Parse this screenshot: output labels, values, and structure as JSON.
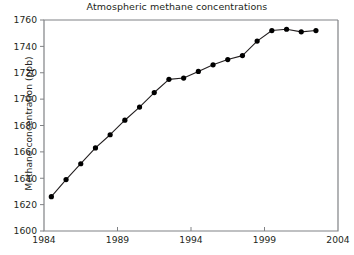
{
  "chart_data": {
    "type": "line",
    "title": "Atmospheric methane concentrations",
    "xlabel": "",
    "ylabel": "Methane concentration (ppb)",
    "xlim": [
      1984,
      2004
    ],
    "ylim": [
      1600,
      1760
    ],
    "xticks": [
      1984,
      1989,
      1994,
      1999,
      2004
    ],
    "xtick_labels": [
      "1984",
      "1989",
      "1994",
      "1999",
      "2004"
    ],
    "yticks": [
      1600,
      1620,
      1640,
      1660,
      1680,
      1700,
      1720,
      1740,
      1760
    ],
    "ytick_labels": [
      "1600",
      "1620",
      "1640",
      "1660",
      "1680",
      "1700",
      "1720",
      "1740",
      "1760"
    ],
    "grid": false,
    "legend": false,
    "marker": "filled-circle",
    "marker_color": "#000000",
    "line_color": "#231f20",
    "x": [
      1984.5,
      1985.5,
      1986.5,
      1987.5,
      1988.5,
      1989.5,
      1990.5,
      1991.5,
      1992.5,
      1993.5,
      1994.5,
      1995.5,
      1996.5,
      1997.5,
      1998.5,
      1999.5,
      2000.5,
      2001.5,
      2002.5
    ],
    "values": [
      1626,
      1639,
      1651,
      1663,
      1673,
      1684,
      1694,
      1705,
      1715,
      1716,
      1721,
      1726,
      1730,
      1733,
      1744,
      1752,
      1753,
      1751,
      1752
    ],
    "series": [
      {
        "name": "Methane concentration",
        "x": [
          1984.5,
          1985.5,
          1986.5,
          1987.5,
          1988.5,
          1989.5,
          1990.5,
          1991.5,
          1992.5,
          1993.5,
          1994.5,
          1995.5,
          1996.5,
          1997.5,
          1998.5,
          1999.5,
          2000.5,
          2001.5,
          2002.5
        ],
        "values": [
          1626,
          1639,
          1651,
          1663,
          1673,
          1684,
          1694,
          1705,
          1715,
          1716,
          1721,
          1726,
          1730,
          1733,
          1744,
          1752,
          1753,
          1751,
          1752
        ]
      }
    ]
  },
  "figure": {
    "title": "Atmospheric methane concentrations",
    "y_axis_title": "Methane concentration (ppb)"
  },
  "colors": {
    "axis": "#808285",
    "text": "#231f20",
    "marker": "#000000",
    "line": "#231f20",
    "background": "#ffffff"
  }
}
